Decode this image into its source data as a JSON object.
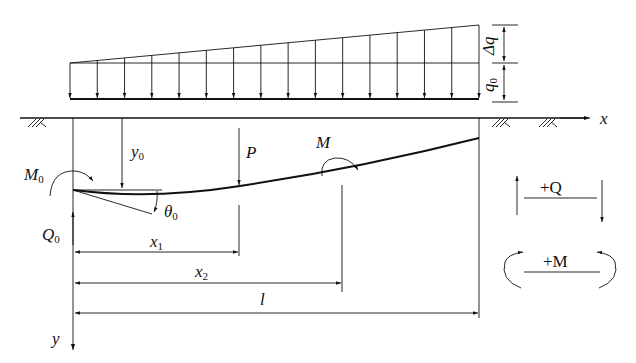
{
  "diagram": {
    "type": "beam-on-elastic-foundation",
    "colors": {
      "line": "#111111",
      "background": "#ffffff"
    },
    "load": {
      "q0_label": "q",
      "q0_sub": "0",
      "dq_label": "Δq",
      "arrow_count": 16
    },
    "axes": {
      "x_label": "x",
      "y_label": "y"
    },
    "boundary": {
      "M0_label": "M",
      "M0_sub": "0",
      "Q0_label": "Q",
      "Q0_sub": "0",
      "y0_label": "y",
      "y0_sub": "0",
      "theta0_label": "θ",
      "theta0_sub": "0"
    },
    "point_loads": {
      "P_label": "P",
      "M_label": "M"
    },
    "dimensions": {
      "x1_label": "x",
      "x1_sub": "1",
      "x2_label": "x",
      "x2_sub": "2",
      "l_label": "l"
    },
    "sign_convention": {
      "shear_label": "+Q",
      "moment_label": "+M"
    }
  }
}
